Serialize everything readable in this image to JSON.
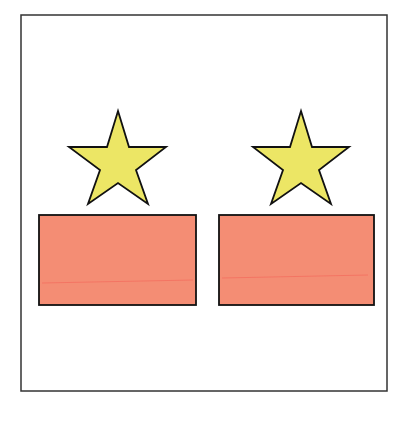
{
  "frame": {
    "x": 21,
    "y": 15,
    "width": 366,
    "height": 376,
    "stroke": "#333333"
  },
  "colors": {
    "star_fill": "#ece665",
    "rect_fill": "#f48d74",
    "outline": "#111111"
  },
  "items": [
    {
      "name": "left",
      "star": {
        "cx": 118,
        "top": 111,
        "arm_y": 147,
        "arm_half": 48,
        "bottom_y": 204,
        "bottom_half": 30,
        "inner": [
          [
            127,
            140
          ],
          [
            100,
            140
          ],
          [
            104,
            172
          ],
          [
            118,
            186
          ],
          [
            132,
            172
          ],
          [
            136,
            140
          ]
        ]
      },
      "rect": {
        "x": 39,
        "y": 214,
        "width": 157,
        "height": 91
      }
    },
    {
      "name": "right",
      "star": {
        "cx": 301,
        "top": 111,
        "arm_y": 147,
        "arm_half": 48,
        "bottom_y": 204,
        "bottom_half": 30
      },
      "rect": {
        "x": 218,
        "y": 214,
        "width": 156,
        "height": 91
      }
    }
  ]
}
